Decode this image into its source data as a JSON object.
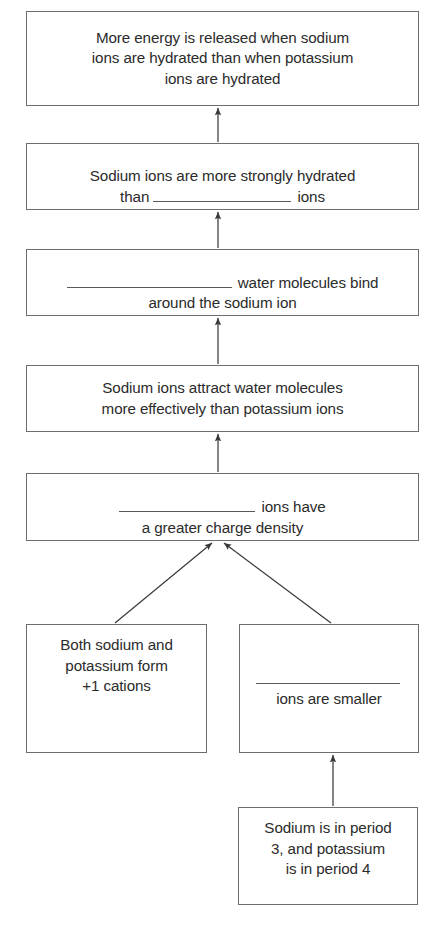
{
  "diagram": {
    "type": "flowchart",
    "orientation": "bottom-to-top",
    "colors": {
      "background": "#ffffff",
      "box_border": "#6d6d6d",
      "text": "#2b2b2b",
      "arrow": "#3a3a3a",
      "blank_rule": "#5a5a5a"
    },
    "nodes": [
      {
        "id": "conclusion",
        "name": "more-energy-released-box",
        "text": "More energy is released when sodium\nions are hydrated than when potassium\nions are hydrated",
        "has_blank": false,
        "x": 26,
        "y": 11,
        "w": 393,
        "h": 95
      },
      {
        "id": "stronger-hydration",
        "name": "sodium-more-strongly-hydrated-box",
        "text_before_blank": "Sodium ions are more strongly hydrated\nthan ",
        "blank_label": "________________",
        "text_after_blank": " ions",
        "has_blank": true,
        "blank_width": 138,
        "x": 26,
        "y": 143,
        "w": 393,
        "h": 67
      },
      {
        "id": "water-binding",
        "name": "water-molecules-bind-box",
        "text_before_blank": "",
        "blank_label": "________________",
        "text_after_blank": " water molecules bind\naround the sodium ion",
        "has_blank": true,
        "blank_width": 165,
        "x": 26,
        "y": 249,
        "w": 393,
        "h": 67
      },
      {
        "id": "attraction",
        "name": "sodium-attracts-water-box",
        "text": "Sodium ions attract water molecules\nmore effectively than potassium ions",
        "has_blank": false,
        "x": 26,
        "y": 365,
        "w": 393,
        "h": 67
      },
      {
        "id": "charge-density",
        "name": "greater-charge-density-box",
        "text_before_blank": "",
        "blank_label": "______________",
        "text_after_blank": " ions have\na greater charge density",
        "has_blank": true,
        "blank_width": 136,
        "x": 26,
        "y": 473,
        "w": 393,
        "h": 68
      },
      {
        "id": "cations",
        "name": "both-form-plus-one-cations-box",
        "text": "Both sodium and\npotassium form\n+1 cations",
        "has_blank": false,
        "x": 26,
        "y": 624,
        "w": 181,
        "h": 129
      },
      {
        "id": "smaller-ions",
        "name": "ions-are-smaller-box",
        "text_before_blank": "",
        "blank_label": "______________",
        "text_after_blank": "\nions are smaller",
        "has_blank": true,
        "blank_width": 144,
        "x": 239,
        "y": 624,
        "w": 180,
        "h": 129
      },
      {
        "id": "periods",
        "name": "sodium-period-three-box",
        "text": "Sodium is in period\n3, and potassium\nis in period 4",
        "has_blank": false,
        "x": 238,
        "y": 807,
        "w": 180,
        "h": 98
      }
    ],
    "arrows": [
      {
        "name": "arrow-stronger-to-conclusion",
        "from": "stronger-hydration",
        "to": "conclusion",
        "x1": 218,
        "y1": 142,
        "x2": 218,
        "y2": 108
      },
      {
        "name": "arrow-water-to-stronger",
        "from": "water-binding",
        "to": "stronger-hydration",
        "x1": 218,
        "y1": 248,
        "x2": 218,
        "y2": 212
      },
      {
        "name": "arrow-attraction-to-water",
        "from": "attraction",
        "to": "water-binding",
        "x1": 218,
        "y1": 364,
        "x2": 218,
        "y2": 318
      },
      {
        "name": "arrow-charge-to-attraction",
        "from": "charge-density",
        "to": "attraction",
        "x1": 218,
        "y1": 472,
        "x2": 218,
        "y2": 434
      },
      {
        "name": "arrow-cations-to-charge",
        "from": "cations",
        "to": "charge-density",
        "x1": 115,
        "y1": 623,
        "x2": 212,
        "y2": 543
      },
      {
        "name": "arrow-smaller-to-charge",
        "from": "smaller-ions",
        "to": "charge-density",
        "x1": 331,
        "y1": 623,
        "x2": 224,
        "y2": 543
      },
      {
        "name": "arrow-periods-to-smaller",
        "from": "periods",
        "to": "smaller-ions",
        "x1": 333,
        "y1": 806,
        "x2": 333,
        "y2": 755
      }
    ]
  }
}
